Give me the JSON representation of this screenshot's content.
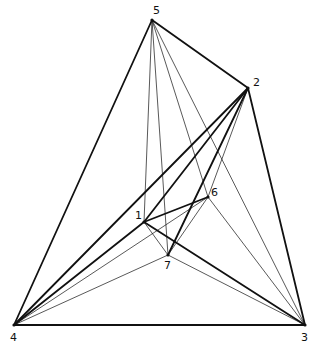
{
  "diagram": {
    "type": "graph",
    "colors": {
      "background": "#ffffff",
      "line": "#111111"
    },
    "vertices": [
      {
        "id": "1",
        "label": "1",
        "x": 144,
        "y": 222,
        "lx": -9,
        "ly": -3
      },
      {
        "id": "2",
        "label": "2",
        "x": 248,
        "y": 88,
        "lx": 5,
        "ly": -2
      },
      {
        "id": "3",
        "label": "3",
        "x": 305,
        "y": 325,
        "lx": -4,
        "ly": 16
      },
      {
        "id": "4",
        "label": "4",
        "x": 14,
        "y": 325,
        "lx": -4,
        "ly": 16
      },
      {
        "id": "5",
        "label": "5",
        "x": 152,
        "y": 20,
        "lx": 1,
        "ly": -6
      },
      {
        "id": "6",
        "label": "6",
        "x": 208,
        "y": 197,
        "lx": 3,
        "ly": -1
      },
      {
        "id": "7",
        "label": "7",
        "x": 168,
        "y": 255,
        "lx": -4,
        "ly": 14
      }
    ],
    "edges": [
      {
        "from": "5",
        "to": "2",
        "weight": "thick"
      },
      {
        "from": "2",
        "to": "3",
        "weight": "thick"
      },
      {
        "from": "3",
        "to": "4",
        "weight": "thick"
      },
      {
        "from": "4",
        "to": "5",
        "weight": "thick"
      },
      {
        "from": "4",
        "to": "2",
        "weight": "thick"
      },
      {
        "from": "1",
        "to": "2",
        "weight": "thick"
      },
      {
        "from": "1",
        "to": "3",
        "weight": "thick"
      },
      {
        "from": "1",
        "to": "4",
        "weight": "thick"
      },
      {
        "from": "1",
        "to": "6",
        "weight": "thick"
      },
      {
        "from": "7",
        "to": "2",
        "weight": "thick"
      },
      {
        "from": "5",
        "to": "1",
        "weight": "thin"
      },
      {
        "from": "5",
        "to": "7",
        "weight": "thin"
      },
      {
        "from": "5",
        "to": "6",
        "weight": "thin"
      },
      {
        "from": "5",
        "to": "3",
        "weight": "thin"
      },
      {
        "from": "2",
        "to": "6",
        "weight": "thin"
      },
      {
        "from": "6",
        "to": "3",
        "weight": "thin"
      },
      {
        "from": "6",
        "to": "7",
        "weight": "thin"
      },
      {
        "from": "6",
        "to": "4",
        "weight": "thin"
      },
      {
        "from": "1",
        "to": "7",
        "weight": "thin"
      },
      {
        "from": "7",
        "to": "4",
        "weight": "thin"
      },
      {
        "from": "7",
        "to": "3",
        "weight": "thin"
      }
    ]
  }
}
